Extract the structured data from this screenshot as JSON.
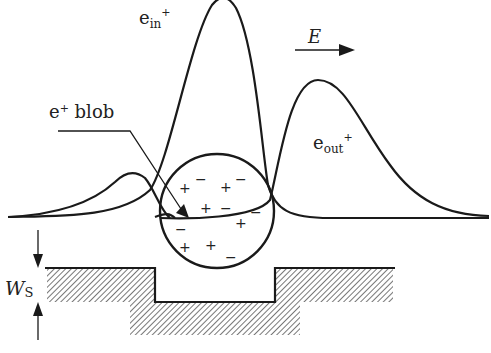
{
  "diagram": {
    "labels": {
      "e_in": {
        "base": "e",
        "sub": "in",
        "sup": "+"
      },
      "e_out": {
        "base": "e",
        "sub": "out",
        "sup": "+"
      },
      "blob": {
        "base": "e",
        "sup": "+",
        "rest": " blob"
      },
      "field": "E",
      "width": {
        "base": "W",
        "sub": "S"
      }
    },
    "blob_signs": [
      {
        "s": "−",
        "x": 200,
        "y": 179
      },
      {
        "s": "−",
        "x": 240,
        "y": 179
      },
      {
        "s": "+",
        "x": 184,
        "y": 188
      },
      {
        "s": "+",
        "x": 225,
        "y": 187
      },
      {
        "s": "+",
        "x": 205,
        "y": 208
      },
      {
        "s": "−",
        "x": 225,
        "y": 208
      },
      {
        "s": "−",
        "x": 255,
        "y": 212
      },
      {
        "s": "−",
        "x": 180,
        "y": 229
      },
      {
        "s": "+",
        "x": 240,
        "y": 223
      },
      {
        "s": "+",
        "x": 184,
        "y": 247
      },
      {
        "s": "+",
        "x": 210,
        "y": 245
      },
      {
        "s": "−",
        "x": 230,
        "y": 257
      }
    ],
    "colors": {
      "line": "#1a1a1a",
      "hatch": "#555555"
    }
  }
}
